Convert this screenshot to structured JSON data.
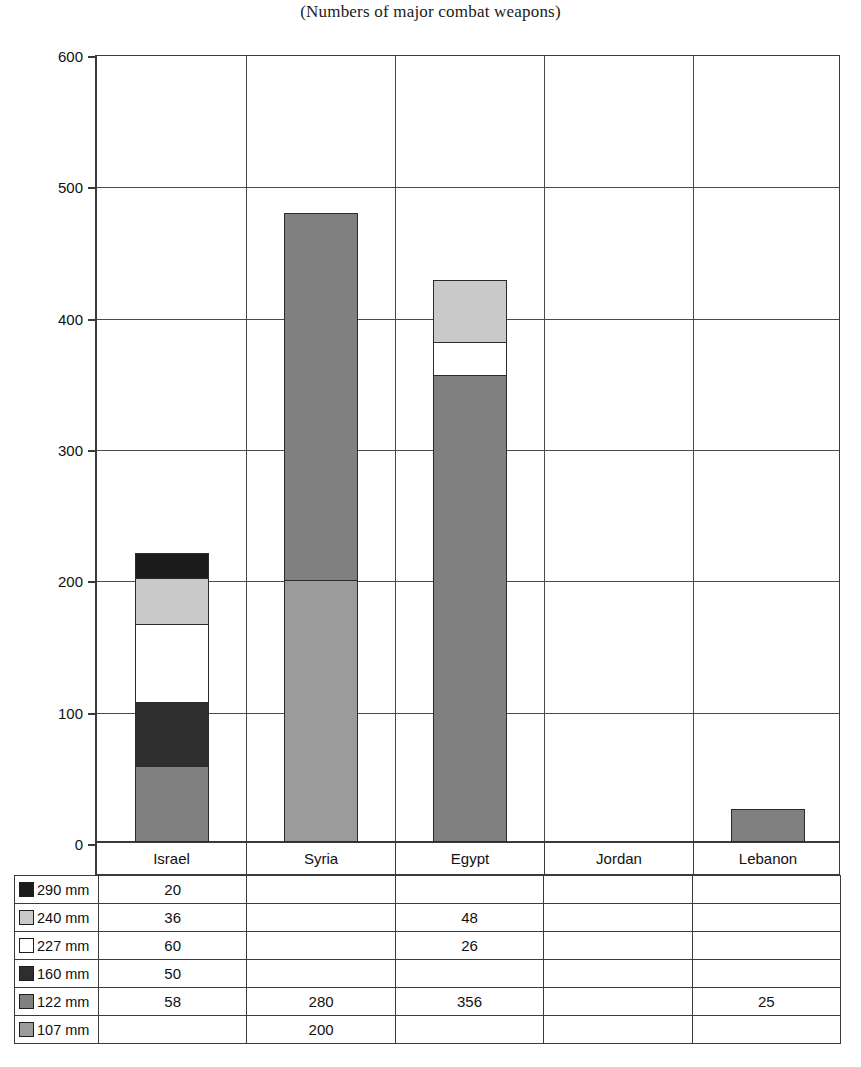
{
  "chart_data": {
    "type": "bar",
    "subtype": "stacked-bar",
    "title": "(Numbers of major combat weapons)",
    "xlabel": "",
    "ylabel": "",
    "ylim": [
      0,
      600
    ],
    "yticks": [
      0,
      100,
      200,
      300,
      400,
      500,
      600
    ],
    "grid": "horizontal-and-vertical",
    "legend_position": "table-below",
    "categories": [
      "Israel",
      "Syria",
      "Egypt",
      "Jordan",
      "Lebanon"
    ],
    "series": [
      {
        "name": "290 mm",
        "color": "#1b1b1b",
        "values": [
          20,
          null,
          null,
          null,
          null
        ]
      },
      {
        "name": "240 mm",
        "color": "#c9c9c9",
        "values": [
          36,
          null,
          48,
          null,
          null
        ]
      },
      {
        "name": "227 mm",
        "color": "#ffffff",
        "values": [
          60,
          null,
          26,
          null,
          null
        ]
      },
      {
        "name": "160 mm",
        "color": "#2e2e2e",
        "values": [
          50,
          null,
          null,
          null,
          null
        ]
      },
      {
        "name": "122 mm",
        "color": "#808080",
        "values": [
          58,
          280,
          356,
          null,
          25
        ]
      },
      {
        "name": "107 mm",
        "color": "#9b9b9b",
        "values": [
          null,
          200,
          null,
          null,
          null
        ]
      }
    ],
    "totals": [
      224,
      480,
      430,
      0,
      25
    ],
    "stack_order_bottom_to_top": [
      "107 mm",
      "122 mm",
      "160 mm",
      "227 mm",
      "240 mm",
      "290 mm"
    ]
  },
  "table": {
    "row_labels": [
      "290 mm",
      "240 mm",
      "227 mm",
      "160 mm",
      "122 mm",
      "107 mm"
    ],
    "column_headers": [
      "Israel",
      "Syria",
      "Egypt",
      "Jordan",
      "Lebanon"
    ],
    "rows": [
      {
        "label": "290 mm",
        "swatch": "#1b1b1b",
        "cells": [
          "20",
          "",
          "",
          "",
          ""
        ]
      },
      {
        "label": "240 mm",
        "swatch": "#c9c9c9",
        "cells": [
          "36",
          "",
          "48",
          "",
          ""
        ]
      },
      {
        "label": "227 mm",
        "swatch": "#ffffff",
        "cells": [
          "60",
          "",
          "26",
          "",
          ""
        ]
      },
      {
        "label": "160 mm",
        "swatch": "#2e2e2e",
        "cells": [
          "50",
          "",
          "",
          "",
          ""
        ]
      },
      {
        "label": "122 mm",
        "swatch": "#808080",
        "cells": [
          "58",
          "280",
          "356",
          "",
          "25"
        ]
      },
      {
        "label": "107 mm",
        "swatch": "#9b9b9b",
        "cells": [
          "",
          "200",
          "",
          "",
          ""
        ]
      }
    ]
  },
  "axis": {
    "y_labels": [
      "600",
      "500",
      "400",
      "300",
      "200",
      "100",
      "0"
    ]
  },
  "colors": {
    "axis": "#3a3a3a",
    "grid": "#4a4a4a",
    "bar_outline": "#2b2b2b",
    "background": "#ffffff"
  }
}
